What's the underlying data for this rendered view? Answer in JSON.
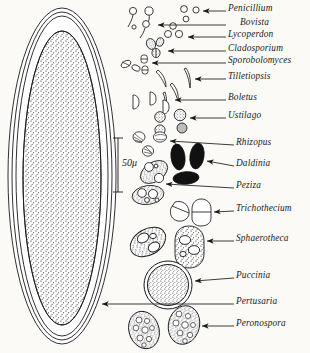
{
  "figure": {
    "background_color": "#fbfaf7",
    "ink_color": "#1a1a1a",
    "scale_bar": {
      "label": "50μ",
      "value": 50,
      "unit": "μ"
    }
  },
  "labels": [
    {
      "name": "Penicillium",
      "text": "Penicillium",
      "x": 228,
      "y": 8
    },
    {
      "name": "Bovista",
      "text": "Bovista",
      "x": 228,
      "y": 22
    },
    {
      "name": "Lycoperdon",
      "text": "Lycoperdon",
      "x": 228,
      "y": 34
    },
    {
      "name": "Cladosporium",
      "text": "Cladosporium",
      "x": 228,
      "y": 48
    },
    {
      "name": "Sporobolomyces",
      "text": "Sporobolomyces",
      "x": 228,
      "y": 60
    },
    {
      "name": "Tilletiopsis",
      "text": "Tilletiopsis",
      "x": 228,
      "y": 76
    },
    {
      "name": "Boletus",
      "text": "Boletus",
      "x": 228,
      "y": 97
    },
    {
      "name": "Ustilago",
      "text": "Ustilago",
      "x": 228,
      "y": 115
    },
    {
      "name": "Rhizopus",
      "text": "Rhizopus",
      "x": 236,
      "y": 142
    },
    {
      "name": "Daldinia",
      "text": "Daldinia",
      "x": 236,
      "y": 163
    },
    {
      "name": "Peziza",
      "text": "Peziza",
      "x": 236,
      "y": 185
    },
    {
      "name": "Trichothecium",
      "text": "Trichothecium",
      "x": 236,
      "y": 208
    },
    {
      "name": "Sphaerotheca",
      "text": "Sphaerotheca",
      "x": 236,
      "y": 238
    },
    {
      "name": "Puccinia",
      "text": "Puccinia",
      "x": 236,
      "y": 275
    },
    {
      "name": "Pertusaria",
      "text": "Pertusaria",
      "x": 236,
      "y": 301
    },
    {
      "name": "Peronospora",
      "text": "Peronospora",
      "x": 236,
      "y": 323
    }
  ],
  "specimens": [
    {
      "name": "pertusaria-spore",
      "label": "Pertusaria",
      "shape": "giant-ellipse-double-wall-stippled"
    },
    {
      "name": "penicillium-spores",
      "label": "Penicillium",
      "shape": "small-circles"
    },
    {
      "name": "bovista-spores",
      "label": "Bovista",
      "shape": "stalked-round-spores"
    },
    {
      "name": "lycoperdon-spores",
      "label": "Lycoperdon",
      "shape": "small-circles"
    },
    {
      "name": "cladosporium-spores",
      "label": "Cladosporium",
      "shape": "dark-stippled-ovoids"
    },
    {
      "name": "sporobolomyces-spores",
      "label": "Sporobolomyces",
      "shape": "small-kidney-and-budding"
    },
    {
      "name": "tilletiopsis-spores",
      "label": "Tilletiopsis",
      "shape": "elongate-sickle"
    },
    {
      "name": "boletus-spores",
      "label": "Boletus",
      "shape": "small-d-shapes"
    },
    {
      "name": "ustilago-spores",
      "label": "Ustilago",
      "shape": "round-stippled"
    },
    {
      "name": "rhizopus-spores",
      "label": "Rhizopus",
      "shape": "striate-ovals"
    },
    {
      "name": "daldinia-spores",
      "label": "Daldinia",
      "shape": "solid-black-ellipses"
    },
    {
      "name": "peziza-spore",
      "label": "Peziza",
      "shape": "oval-with-two-guttules"
    },
    {
      "name": "trichothecium-spores",
      "label": "Trichothecium",
      "shape": "two-celled-pyriform"
    },
    {
      "name": "sphaerotheca-spores",
      "label": "Sphaerotheca",
      "shape": "large-stippled-ovals"
    },
    {
      "name": "puccinia-spore",
      "label": "Puccinia",
      "shape": "large-round-thick-wall"
    },
    {
      "name": "peronospora-spores",
      "label": "Peronospora",
      "shape": "oval-vacuolate"
    }
  ]
}
